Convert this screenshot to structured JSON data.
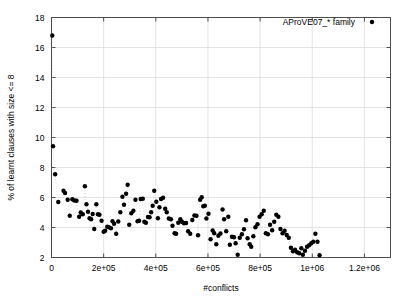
{
  "chart_data": {
    "type": "scatter",
    "title": "",
    "xlabel": "#conflicts",
    "ylabel": "% of learnt clauses with size <= 8",
    "xlim": [
      0,
      1300000
    ],
    "ylim": [
      2,
      18
    ],
    "xticks": [
      0,
      200000,
      400000,
      600000,
      800000,
      1000000,
      1200000
    ],
    "xtick_labels": [
      "0",
      "2e+05",
      "4e+05",
      "6e+05",
      "8e+05",
      "1e+06",
      "1.2e+06"
    ],
    "yticks": [
      2,
      4,
      6,
      8,
      10,
      12,
      14,
      16,
      18
    ],
    "ytick_labels": [
      "2",
      "4",
      "6",
      "8",
      "10",
      "12",
      "14",
      "16",
      "18"
    ],
    "grid": true,
    "grid_color": "#d9d9d9",
    "marker_color": "#000000",
    "marker_size": 3.2,
    "connector_style": "dotted",
    "connector_color": "#cccccc",
    "legend": {
      "position": "top-right",
      "entries": [
        {
          "label": "AProVE07_* family",
          "marker": "filled-circle",
          "color": "#000000"
        }
      ]
    },
    "series": [
      {
        "name": "AProVE07_* family",
        "points": [
          [
            3000,
            16.8
          ],
          [
            6000,
            9.42
          ],
          [
            14000,
            7.55
          ],
          [
            26000,
            5.7
          ],
          [
            46000,
            6.45
          ],
          [
            52000,
            6.3
          ],
          [
            62000,
            5.85
          ],
          [
            70000,
            4.78
          ],
          [
            80000,
            5.88
          ],
          [
            88000,
            5.8
          ],
          [
            96000,
            5.78
          ],
          [
            106000,
            4.72
          ],
          [
            112000,
            5.0
          ],
          [
            120000,
            4.88
          ],
          [
            128000,
            6.75
          ],
          [
            134000,
            5.55
          ],
          [
            140000,
            5.05
          ],
          [
            146000,
            4.62
          ],
          [
            152000,
            4.55
          ],
          [
            158000,
            4.9
          ],
          [
            164000,
            3.9
          ],
          [
            172000,
            5.55
          ],
          [
            178000,
            4.88
          ],
          [
            184000,
            4.85
          ],
          [
            192000,
            4.45
          ],
          [
            200000,
            3.72
          ],
          [
            206000,
            3.78
          ],
          [
            214000,
            4.05
          ],
          [
            220000,
            4.02
          ],
          [
            228000,
            3.95
          ],
          [
            234000,
            4.42
          ],
          [
            240000,
            4.25
          ],
          [
            248000,
            3.58
          ],
          [
            256000,
            4.4
          ],
          [
            264000,
            5.02
          ],
          [
            272000,
            6.05
          ],
          [
            278000,
            5.52
          ],
          [
            286000,
            6.25
          ],
          [
            292000,
            6.85
          ],
          [
            298000,
            4.18
          ],
          [
            306000,
            4.95
          ],
          [
            314000,
            5.12
          ],
          [
            322000,
            5.85
          ],
          [
            330000,
            4.42
          ],
          [
            336000,
            4.45
          ],
          [
            342000,
            5.9
          ],
          [
            350000,
            5.92
          ],
          [
            356000,
            4.38
          ],
          [
            362000,
            4.32
          ],
          [
            370000,
            4.7
          ],
          [
            376000,
            4.68
          ],
          [
            382000,
            5.02
          ],
          [
            388000,
            5.45
          ],
          [
            394000,
            6.45
          ],
          [
            402000,
            5.72
          ],
          [
            408000,
            4.62
          ],
          [
            414000,
            5.35
          ],
          [
            420000,
            5.9
          ],
          [
            428000,
            5.98
          ],
          [
            436000,
            5.25
          ],
          [
            442000,
            5.02
          ],
          [
            450000,
            4.6
          ],
          [
            458000,
            4.55
          ],
          [
            464000,
            4.12
          ],
          [
            472000,
            3.62
          ],
          [
            478000,
            3.58
          ],
          [
            486000,
            4.32
          ],
          [
            494000,
            4.55
          ],
          [
            500000,
            4.38
          ],
          [
            508000,
            4.28
          ],
          [
            516000,
            4.3
          ],
          [
            524000,
            3.75
          ],
          [
            532000,
            3.58
          ],
          [
            540000,
            4.5
          ],
          [
            548000,
            4.8
          ],
          [
            556000,
            4.78
          ],
          [
            562000,
            3.48
          ],
          [
            570000,
            5.85
          ],
          [
            576000,
            6.02
          ],
          [
            582000,
            5.42
          ],
          [
            588000,
            5.45
          ],
          [
            594000,
            4.6
          ],
          [
            602000,
            4.92
          ],
          [
            610000,
            3.22
          ],
          [
            618000,
            3.8
          ],
          [
            624000,
            3.62
          ],
          [
            632000,
            2.88
          ],
          [
            640000,
            3.45
          ],
          [
            648000,
            3.6
          ],
          [
            656000,
            5.2
          ],
          [
            662000,
            4.55
          ],
          [
            670000,
            3.75
          ],
          [
            678000,
            4.72
          ],
          [
            684000,
            2.85
          ],
          [
            692000,
            3.38
          ],
          [
            700000,
            3.35
          ],
          [
            706000,
            2.95
          ],
          [
            714000,
            2.18
          ],
          [
            722000,
            3.32
          ],
          [
            730000,
            3.55
          ],
          [
            738000,
            3.88
          ],
          [
            746000,
            4.48
          ],
          [
            752000,
            3.28
          ],
          [
            760000,
            2.88
          ],
          [
            766000,
            2.72
          ],
          [
            774000,
            3.42
          ],
          [
            782000,
            4.02
          ],
          [
            790000,
            4.22
          ],
          [
            798000,
            4.72
          ],
          [
            806000,
            4.88
          ],
          [
            814000,
            5.12
          ],
          [
            822000,
            3.62
          ],
          [
            830000,
            3.55
          ],
          [
            838000,
            4.18
          ],
          [
            846000,
            3.82
          ],
          [
            854000,
            4.38
          ],
          [
            862000,
            4.85
          ],
          [
            870000,
            4.72
          ],
          [
            878000,
            3.9
          ],
          [
            886000,
            3.62
          ],
          [
            894000,
            3.78
          ],
          [
            902000,
            3.5
          ],
          [
            910000,
            3.32
          ],
          [
            918000,
            2.65
          ],
          [
            926000,
            2.42
          ],
          [
            934000,
            2.52
          ],
          [
            942000,
            2.35
          ],
          [
            950000,
            2.28
          ],
          [
            958000,
            2.62
          ],
          [
            964000,
            2.18
          ],
          [
            972000,
            2.45
          ],
          [
            980000,
            2.72
          ],
          [
            988000,
            2.82
          ],
          [
            996000,
            2.95
          ],
          [
            1004000,
            3.05
          ],
          [
            1012000,
            3.58
          ],
          [
            1020000,
            3.05
          ],
          [
            1028000,
            2.15
          ]
        ]
      }
    ]
  }
}
